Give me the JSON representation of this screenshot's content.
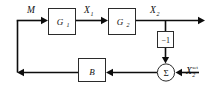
{
  "diagram": {
    "type": "block-diagram",
    "background_color": "#ffffff",
    "line_color": "#0d0d0d",
    "box_stroke_color": "#2b2b2b",
    "box_fill_color": "#ffffff",
    "text_color": "#101010",
    "blocks": [
      {
        "id": "g1",
        "label": "G",
        "subscript": "1",
        "shape": "rect",
        "x": 48,
        "y": 8,
        "w": 28,
        "h": 27
      },
      {
        "id": "g2",
        "label": "G",
        "subscript": "2",
        "shape": "rect",
        "x": 108,
        "y": 8,
        "w": 28,
        "h": 27
      },
      {
        "id": "gain",
        "label": "−1",
        "subscript": "",
        "shape": "rect",
        "x": 157,
        "y": 31,
        "w": 17,
        "h": 17
      },
      {
        "id": "b",
        "label": "B",
        "subscript": "",
        "shape": "rect",
        "x": 78,
        "y": 58,
        "w": 28,
        "h": 24
      },
      {
        "id": "sum",
        "label": "Σ",
        "subscript": "",
        "shape": "circle",
        "cx": 166,
        "cy": 72,
        "r": 9
      }
    ],
    "signals": [
      {
        "id": "m",
        "label": "M",
        "subscript": "",
        "superscript": "",
        "x": 30,
        "y": 11
      },
      {
        "id": "x1",
        "label": "X",
        "subscript": "1",
        "superscript": "",
        "x": 86,
        "y": 11
      },
      {
        "id": "x2",
        "label": "X",
        "subscript": "2",
        "superscript": "",
        "x": 152,
        "y": 11
      },
      {
        "id": "x2set",
        "label": "X",
        "subscript": "2",
        "superscript": "set",
        "x": 189,
        "y": 71
      }
    ],
    "connections": [
      {
        "from": "feedback-corner",
        "to": "g1",
        "direction": "right"
      },
      {
        "from": "g1",
        "to": "g2",
        "direction": "right"
      },
      {
        "from": "g2",
        "to": "x2-output",
        "direction": "right"
      },
      {
        "from": "x2-branch",
        "to": "gain",
        "direction": "down"
      },
      {
        "from": "gain",
        "to": "sum",
        "direction": "down"
      },
      {
        "from": "x2set-input",
        "to": "sum",
        "direction": "left"
      },
      {
        "from": "sum",
        "to": "b",
        "direction": "left"
      },
      {
        "from": "b",
        "to": "feedback-left",
        "direction": "left"
      },
      {
        "from": "feedback-left",
        "to": "feedback-corner",
        "direction": "up"
      }
    ]
  }
}
